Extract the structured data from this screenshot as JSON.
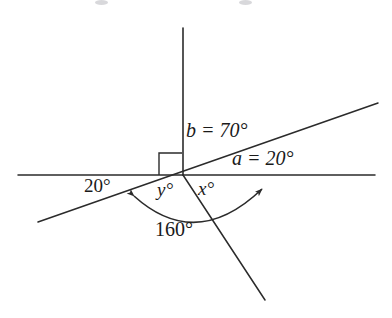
{
  "figure": {
    "kind": "geometry-angle-diagram",
    "background_color": "#ffffff",
    "stroke_color": "#2b2b2b",
    "text_color": "#1a1a1a",
    "vertex": {
      "x": 183,
      "y": 175
    },
    "lines": [
      {
        "name": "horizontal-line",
        "x1": 18,
        "y1": 175,
        "x2": 375,
        "y2": 175
      },
      {
        "name": "vertical-ray",
        "x1": 183,
        "y1": 28,
        "x2": 183,
        "y2": 175
      },
      {
        "name": "slanted-line",
        "x1": 38,
        "y1": 222,
        "x2": 378,
        "y2": 103
      },
      {
        "name": "descending-ray",
        "x1": 183,
        "y1": 175,
        "x2": 265,
        "y2": 300
      }
    ],
    "right_angle_marker": {
      "name": "right-angle-square",
      "x": 159,
      "y": 152,
      "size": 21
    },
    "arc": {
      "name": "angle-arc-160",
      "center_x": 183,
      "center_y": 175,
      "radius": 62,
      "start_x": 134,
      "start_y": 196,
      "end_x": 262,
      "end_y": 189,
      "double_headed": true
    }
  },
  "labels": {
    "b_angle": "b = 70°",
    "a_angle": "a = 20°",
    "left_angle": "20°",
    "y_angle": "y°",
    "x_angle": "x°",
    "arc_angle": "160°"
  }
}
